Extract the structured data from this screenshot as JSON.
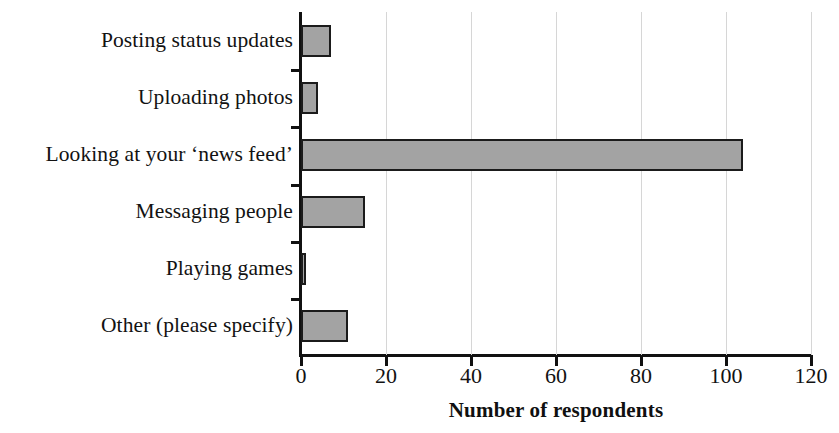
{
  "chart_data": {
    "type": "bar",
    "orientation": "horizontal",
    "title": "",
    "xlabel": "Number of respondents",
    "ylabel": "",
    "categories": [
      "Posting status updates",
      "Uploading photos",
      "Looking at your ‘news feed’",
      "Messaging people",
      "Playing games",
      "Other (please specify)"
    ],
    "values": [
      7,
      4,
      104,
      15,
      1,
      11
    ],
    "xlim": [
      0,
      120
    ],
    "xticks": [
      0,
      20,
      40,
      60,
      80,
      100,
      120
    ],
    "xticklabels": [
      "0",
      "20",
      "40",
      "60",
      "80",
      "100",
      "120"
    ],
    "grid": "vertical",
    "legend": "none",
    "colors": {
      "bar_fill": "#a3a3a3",
      "bar_border": "#1b1b1b",
      "gridline": "#d6d6d6",
      "axis": "#111111",
      "text": "#121212",
      "background": "#ffffff"
    }
  }
}
